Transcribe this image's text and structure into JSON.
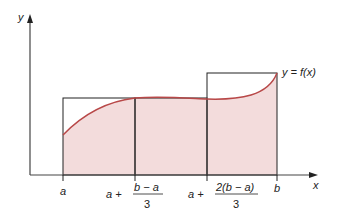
{
  "diagram": {
    "axis_labels": {
      "y": "y",
      "x": "x"
    },
    "curve_label": "y = f(x)",
    "tick_labels": {
      "a": "a",
      "t1_prefix": "a +",
      "t1_num": "b − a",
      "t1_den": "3",
      "t2_prefix": "a +",
      "t2_num": "2(b − a)",
      "t2_den": "3",
      "b": "b"
    },
    "colors": {
      "fill": "#f3dcdc",
      "curve": "#b84848",
      "lines": "#222222"
    }
  }
}
